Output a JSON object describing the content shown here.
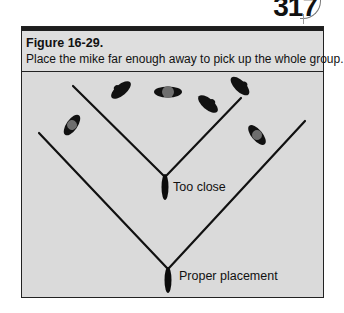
{
  "page": {
    "number": "317"
  },
  "figure": {
    "title": "Figure 16-29.",
    "caption": "Place the mike far enough away to pick up the whole group."
  },
  "diagram": {
    "labels": {
      "too_close": "Too close",
      "proper": "Proper placement"
    },
    "colors": {
      "background": "#dadada",
      "line": "#111111",
      "person_body": "#111111",
      "person_head": "#6e6e6e"
    }
  }
}
